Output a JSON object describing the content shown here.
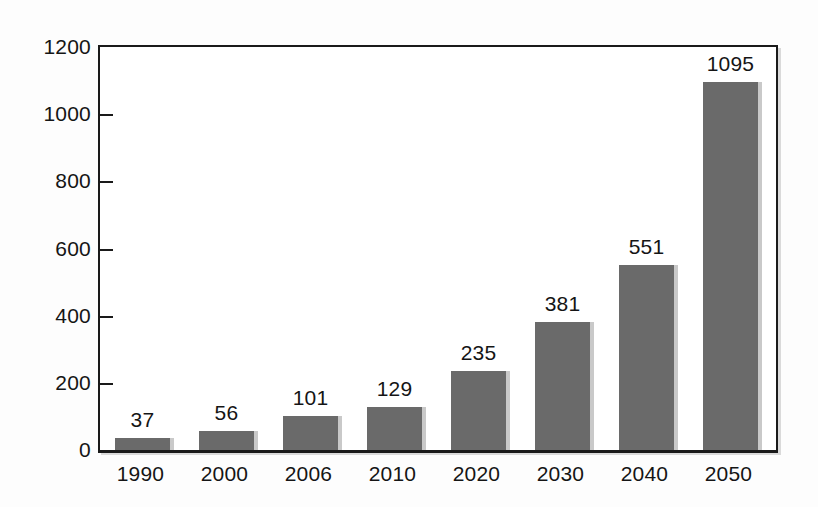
{
  "chart_data": {
    "type": "bar",
    "title": "",
    "subtitle": "",
    "xlabel": "",
    "ylabel": "",
    "categories": [
      "1990",
      "2000",
      "2006",
      "2010",
      "2020",
      "2030",
      "2040",
      "2050"
    ],
    "values": [
      37,
      56,
      101,
      129,
      235,
      381,
      551,
      1095
    ],
    "value_labels": [
      "37",
      "56",
      "101",
      "129",
      "235",
      "381",
      "551",
      "1095"
    ],
    "ylim": [
      0,
      1200
    ],
    "y_ticks": [
      0,
      200,
      400,
      600,
      800,
      1000,
      1200
    ],
    "y_tick_labels": [
      "0",
      "200",
      "400",
      "600",
      "800",
      "1000",
      "1200"
    ],
    "grid": false,
    "legend": null,
    "legend_position": "none",
    "series": [
      {
        "name": "",
        "values": [
          37,
          56,
          101,
          129,
          235,
          381,
          551,
          1095
        ]
      }
    ],
    "colors": {
      "bar_fill": "#6a6a6a",
      "bar_shadow": "#c9c9c9",
      "axis": "#1a1a1a",
      "text": "#151515",
      "plot_background": "#ffffff",
      "page_background": "#fdfdfd"
    }
  }
}
